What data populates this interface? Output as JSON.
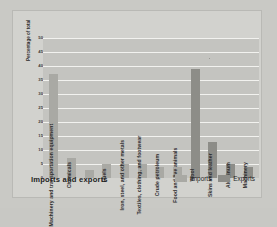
{
  "chart": {
    "title": "Imports and exports",
    "ylabel": "Percentage of total",
    "legend": [
      {
        "key": "imports",
        "label": "Imports",
        "color": "#a9a9a4"
      },
      {
        "key": "exports",
        "label": "Exports",
        "color": "#8d8d88"
      }
    ]
  },
  "chart_data": {
    "type": "bar",
    "title": "Imports and exports",
    "xlabel": "",
    "ylabel": "Percentage of total",
    "ylim": [
      0,
      50
    ],
    "yticks": [
      0,
      5,
      10,
      15,
      20,
      25,
      30,
      35,
      40,
      45,
      50
    ],
    "grid": true,
    "legend_position": "bottom-right",
    "categories": [
      "Machinery and transportation equipment",
      "Chemicals",
      "",
      "Fuels",
      "Iron, steel, and other metals",
      "Textiles, clothing, and footwear",
      "Crude petroleum",
      "Food and live animals",
      "Wool",
      "Skins and leather",
      "Aluminum",
      "Machinery"
    ],
    "series": [
      {
        "name": "Imports",
        "color": "#a9a9a4",
        "values": [
          37,
          7,
          3,
          5,
          5,
          5,
          4,
          4,
          null,
          null,
          null,
          null
        ]
      },
      {
        "name": "Exports",
        "color": "#8d8d88",
        "values": [
          null,
          null,
          null,
          null,
          null,
          null,
          null,
          null,
          39,
          13,
          5,
          4
        ]
      }
    ],
    "bars": [
      {
        "category": "Machinery and transportation equipment",
        "value": 37,
        "series": "Imports"
      },
      {
        "category": "Chemicals",
        "value": 7,
        "series": "Imports"
      },
      {
        "category": "",
        "value": 3,
        "series": "Imports"
      },
      {
        "category": "Fuels",
        "value": 5,
        "series": "Imports"
      },
      {
        "category": "Iron, steel, and other metals",
        "value": 5,
        "series": "Imports"
      },
      {
        "category": "Textiles, clothing, and footwear",
        "value": 5,
        "series": "Imports"
      },
      {
        "category": "Crude petroleum",
        "value": 4,
        "series": "Imports"
      },
      {
        "category": "Food and live animals",
        "value": 4,
        "series": "Imports"
      },
      {
        "category": "Wool",
        "value": 39,
        "series": "Exports"
      },
      {
        "category": "Skins and leather",
        "value": 13,
        "series": "Exports"
      },
      {
        "category": "Aluminum",
        "value": 5,
        "series": "Exports"
      },
      {
        "category": "Machinery",
        "value": 4,
        "series": "Exports"
      }
    ]
  }
}
